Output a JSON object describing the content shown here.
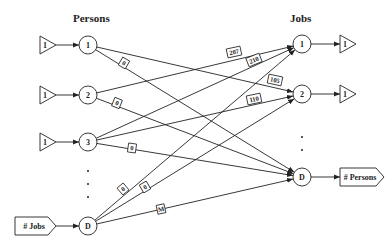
{
  "headers": {
    "persons": "Persons",
    "jobs": "Jobs"
  },
  "persons": [
    {
      "id": "P1",
      "label": "1",
      "x": 88,
      "y": 45,
      "supply": "1"
    },
    {
      "id": "P2",
      "label": "2",
      "x": 88,
      "y": 95,
      "supply": "1"
    },
    {
      "id": "P3",
      "label": "3",
      "x": 88,
      "y": 142,
      "supply": "1"
    },
    {
      "id": "PD",
      "label": "D",
      "x": 88,
      "y": 226,
      "supply": "# Jobs"
    }
  ],
  "jobs": [
    {
      "id": "J1",
      "label": "1",
      "x": 302,
      "y": 44,
      "demand": "1"
    },
    {
      "id": "J2",
      "label": "2",
      "x": 302,
      "y": 94,
      "demand": "1"
    },
    {
      "id": "JD",
      "label": "D",
      "x": 302,
      "y": 177,
      "demand": "# Persons"
    }
  ],
  "edges": [
    {
      "from": "P1",
      "to": "J2",
      "cost": "105",
      "lx": 275,
      "ly": 80,
      "angle": 12
    },
    {
      "from": "P1",
      "to": "JD",
      "cost": "0",
      "lx": 124,
      "ly": 63,
      "angle": 30
    },
    {
      "from": "P2",
      "to": "J1",
      "cost": "207",
      "lx": 234,
      "ly": 52,
      "angle": -12
    },
    {
      "from": "P2",
      "to": "JD",
      "cost": "0",
      "lx": 117,
      "ly": 103,
      "angle": 22
    },
    {
      "from": "P3",
      "to": "J1",
      "cost": "210",
      "lx": 254,
      "ly": 60,
      "angle": -22
    },
    {
      "from": "P3",
      "to": "J2",
      "cost": "110",
      "lx": 254,
      "ly": 99,
      "angle": -12
    },
    {
      "from": "P3",
      "to": "JD",
      "cost": "0",
      "lx": 132,
      "ly": 148,
      "angle": 8
    },
    {
      "from": "PD",
      "to": "J1",
      "cost": "0",
      "lx": 123,
      "ly": 189,
      "angle": -40
    },
    {
      "from": "PD",
      "to": "J2",
      "cost": "0",
      "lx": 145,
      "ly": 187,
      "angle": -30
    },
    {
      "from": "PD",
      "to": "JD",
      "cost": "M",
      "lx": 161,
      "ly": 209,
      "angle": -12
    }
  ],
  "ellipsis": {
    "persons": [
      [
        88,
        171
      ],
      [
        88,
        184
      ],
      [
        88,
        197
      ]
    ],
    "jobs": [
      [
        302,
        137
      ],
      [
        302,
        150
      ]
    ]
  }
}
